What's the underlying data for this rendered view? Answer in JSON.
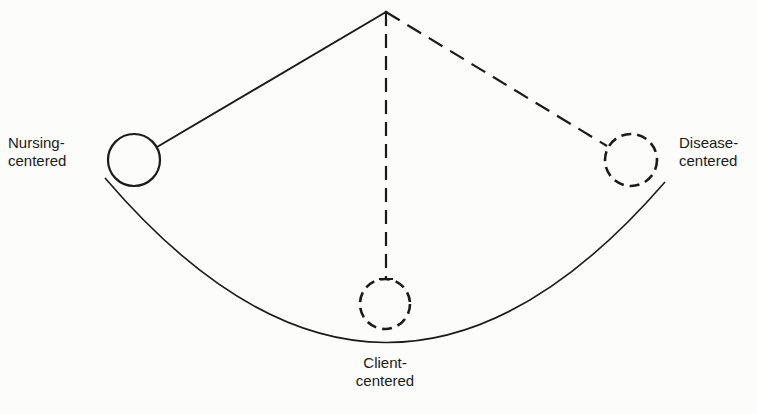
{
  "diagram": {
    "type": "pendulum",
    "colors": {
      "stroke": "#1a1a1a",
      "background": "#fcfcfb"
    },
    "pivot": {
      "x": 386,
      "y": 12
    },
    "arc": {
      "start": {
        "x": 105,
        "y": 178
      },
      "bottom": {
        "x": 385,
        "y": 344
      },
      "end": {
        "x": 665,
        "y": 182
      }
    },
    "nodes": [
      {
        "id": "nursing",
        "label_line1": "Nursing-",
        "label_line2": "centered",
        "circle_style": "solid",
        "link_style": "solid",
        "position": "left"
      },
      {
        "id": "client",
        "label_line1": "Client-",
        "label_line2": "centered",
        "circle_style": "dashed",
        "link_style": "dashed",
        "position": "bottom"
      },
      {
        "id": "disease",
        "label_line1": "Disease-",
        "label_line2": "centered",
        "circle_style": "dashed",
        "link_style": "dashed",
        "position": "right"
      }
    ]
  }
}
